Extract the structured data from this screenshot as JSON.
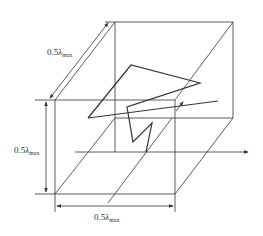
{
  "diagram": {
    "type": "cube-with-random-path",
    "stroke_color": "#333333",
    "labels": {
      "depth": {
        "prefix": "0.5",
        "symbol": "λ",
        "subscript": "max"
      },
      "height": {
        "prefix": "0.5",
        "symbol": "λ",
        "subscript": "max"
      },
      "width": {
        "prefix": "0.5",
        "symbol": "λ",
        "subscript": "max"
      }
    },
    "cube": {
      "back_face": [
        [
          115,
          22
        ],
        [
          233,
          22
        ],
        [
          233,
          118
        ],
        [
          115,
          118
        ]
      ],
      "front_face": [
        [
          55,
          100
        ],
        [
          175,
          100
        ],
        [
          175,
          194
        ],
        [
          55,
          194
        ]
      ]
    },
    "axis_arrow": {
      "from": [
        75,
        152
      ],
      "to": [
        248,
        152
      ]
    },
    "path_points": [
      [
        88,
        118
      ],
      [
        131,
        65
      ],
      [
        200,
        83
      ],
      [
        127,
        107
      ],
      [
        133,
        142
      ],
      [
        152,
        123
      ],
      [
        146,
        152
      ]
    ],
    "ray_line": {
      "from": [
        88,
        118
      ],
      "to": [
        218,
        101
      ]
    },
    "small_arrow": {
      "from": [
        175,
        112
      ],
      "to": [
        183,
        102
      ]
    }
  }
}
